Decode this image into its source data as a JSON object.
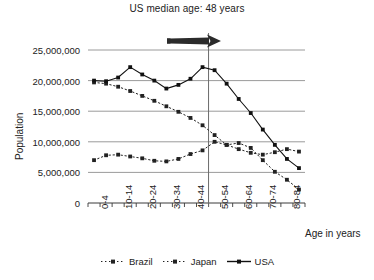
{
  "chart_data": {
    "type": "line",
    "title": "US median age: 48 years",
    "xlabel": "Age in years",
    "ylabel": "Population",
    "ylim": [
      0,
      25000000
    ],
    "ytick_values": [
      0,
      5000000,
      10000000,
      15000000,
      20000000,
      25000000
    ],
    "ytick_labels": [
      "0",
      "5,000,000",
      "10,000,000",
      "15,000,000",
      "20,000,000",
      "25,000,000"
    ],
    "grid": "horizontal",
    "legend_position": "bottom",
    "categories": [
      "0-4",
      "5-9",
      "10-14",
      "15-19",
      "20-24",
      "25-29",
      "30-34",
      "35-39",
      "40-44",
      "45-49",
      "50-54",
      "55-59",
      "60-64",
      "65-69",
      "70-74",
      "75-79",
      "80-84",
      "85+"
    ],
    "xtick_labels_shown": [
      "0-4",
      "10-14",
      "20-24",
      "30-34",
      "40-44",
      "50-54",
      "60-64",
      "70-74",
      "80-84"
    ],
    "series": [
      {
        "name": "Brazil",
        "style": "dotted",
        "marker": "square",
        "color": "#222222",
        "values": [
          7000000,
          7800000,
          7900000,
          7600000,
          7300000,
          6900000,
          6800000,
          7200000,
          8000000,
          8600000,
          10000000,
          9500000,
          8800000,
          8200000,
          7900000,
          8300000,
          8800000,
          8400000
        ]
      },
      {
        "name": "Japan",
        "style": "dotted",
        "marker": "square",
        "color": "#222222",
        "values": [
          19700000,
          19500000,
          19000000,
          18300000,
          17500000,
          16700000,
          15800000,
          14900000,
          13900000,
          12700000,
          11100000,
          9500000,
          9800000,
          9000000,
          7000000,
          5100000,
          3800000,
          2200000
        ]
      },
      {
        "name": "USA",
        "style": "solid",
        "marker": "square",
        "color": "#111111",
        "values": [
          20000000,
          19900000,
          20500000,
          22200000,
          21000000,
          20000000,
          18700000,
          19300000,
          20300000,
          22200000,
          21700000,
          19500000,
          17000000,
          14700000,
          12000000,
          9500000,
          7200000,
          5700000
        ]
      }
    ],
    "annotations": [
      {
        "type": "vline",
        "at_category": "median-age-48",
        "label": ""
      },
      {
        "type": "arrow",
        "direction": "right",
        "label": ""
      }
    ]
  },
  "legend": {
    "items": [
      {
        "label": "Brazil"
      },
      {
        "label": "Japan"
      },
      {
        "label": "USA"
      }
    ]
  }
}
